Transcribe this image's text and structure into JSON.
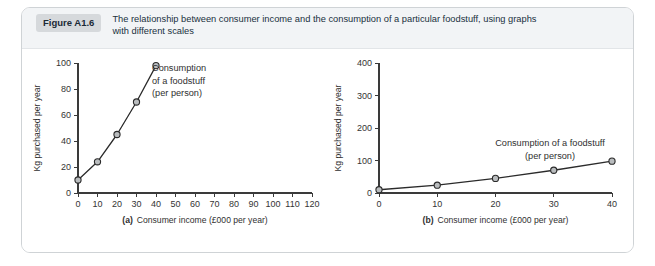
{
  "figure": {
    "badge": "Figure A1.6",
    "caption_line1": "The relationship between consumer income and the consumption of a particular foodstuff, using graphs",
    "caption_line2": "with different scales"
  },
  "colors": {
    "card_border": "#cfd3d6",
    "header_bg": "#f2f4f6",
    "badge_bg": "#d6d9dc",
    "axis": "#3a3a3a",
    "line": "#2b2b2b",
    "marker_fill": "#b9bcbe"
  },
  "chart_data": [
    {
      "type": "line",
      "panel": "a",
      "title": "",
      "xlabel_prefix": "(a)",
      "xlabel": "Consumer income (£000 per year)",
      "ylabel": "Kg purchased per year",
      "x": [
        0,
        10,
        20,
        30,
        40
      ],
      "values": [
        10,
        24,
        45,
        70,
        98
      ],
      "xlim": [
        0,
        120
      ],
      "ylim": [
        0,
        100
      ],
      "xticks": [
        0,
        10,
        20,
        30,
        40,
        50,
        60,
        70,
        80,
        90,
        100,
        110,
        120
      ],
      "yticks": [
        0,
        20,
        40,
        60,
        80,
        100
      ],
      "grid": false,
      "legend": "none",
      "annotation_lines": [
        "Consumption",
        "of a foodstuff",
        "(per person)"
      ]
    },
    {
      "type": "line",
      "panel": "b",
      "title": "",
      "xlabel_prefix": "(b)",
      "xlabel": "Consumer income (£000 per year)",
      "ylabel": "Kg purchased per year",
      "x": [
        0,
        10,
        20,
        30,
        40
      ],
      "values": [
        10,
        24,
        45,
        70,
        98
      ],
      "xlim": [
        0,
        40
      ],
      "ylim": [
        0,
        400
      ],
      "xticks": [
        0,
        10,
        20,
        30,
        40
      ],
      "yticks": [
        0,
        100,
        200,
        300,
        400
      ],
      "grid": false,
      "legend": "none",
      "annotation_lines": [
        "Consumption of a foodstuff",
        "(per person)"
      ]
    }
  ]
}
